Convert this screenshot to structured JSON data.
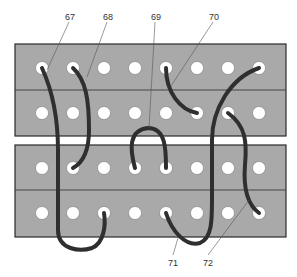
{
  "diagram": {
    "title": "",
    "panels": [
      {
        "name": "upper-patch-panel",
        "rows": 2,
        "columns": 8
      },
      {
        "name": "lower-patch-panel",
        "rows": 2,
        "columns": 8
      }
    ],
    "colors": {
      "panel": "#a9a9a9",
      "wire": "#2f2f2f",
      "hole": "#ffffff"
    },
    "cables": [
      {
        "id": "67",
        "label": "67",
        "from": "upper row1 col1",
        "to": "lower row2 col3"
      },
      {
        "id": "68",
        "label": "68",
        "from": "upper row1 col2",
        "to": "lower row1 col2"
      },
      {
        "id": "69",
        "label": "69",
        "from": "lower row1 col4",
        "to": "lower row1 col5"
      },
      {
        "id": "70",
        "label": "70",
        "from": "upper row1 col5",
        "to": "upper row2 col6"
      },
      {
        "id": "71",
        "label": "71",
        "from": "lower row2 col5",
        "to": "upper row1 col8"
      },
      {
        "id": "72",
        "label": "72",
        "from": "upper row2 col7",
        "to": "lower row2 col8"
      }
    ]
  }
}
